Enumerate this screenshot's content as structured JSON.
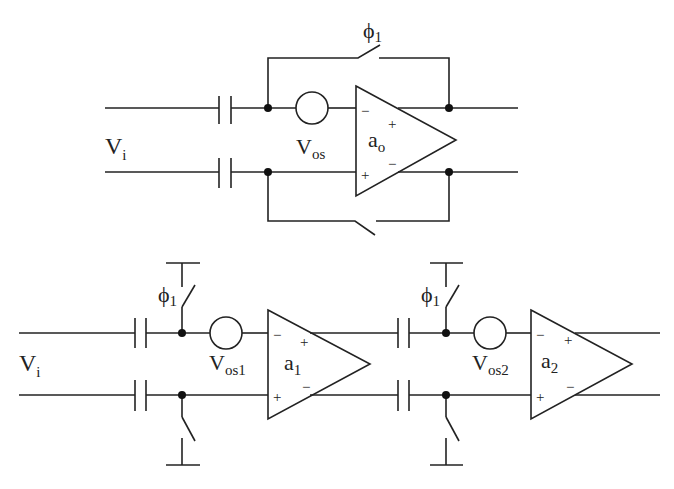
{
  "diagram": {
    "type": "circuit-schematic",
    "top_circuit": {
      "input_label": "V",
      "input_sub": "i",
      "offset_label": "V",
      "offset_sub": "os",
      "amp_label": "a",
      "amp_sub": "o",
      "switch_label": "ϕ",
      "switch_sub": "1",
      "in_minus": "−",
      "in_plus": "+",
      "out_plus": "+",
      "out_minus": "−"
    },
    "bottom_circuit": {
      "input_label": "V",
      "input_sub": "i",
      "stage1": {
        "switch_label": "ϕ",
        "switch_sub": "1",
        "offset_label": "V",
        "offset_sub": "os1",
        "amp_label": "a",
        "amp_sub": "1",
        "in_minus": "−",
        "in_plus": "+",
        "out_plus": "+",
        "out_minus": "−"
      },
      "stage2": {
        "switch_label": "ϕ",
        "switch_sub": "1",
        "offset_label": "V",
        "offset_sub": "os2",
        "amp_label": "a",
        "amp_sub": "2",
        "in_minus": "−",
        "in_plus": "+",
        "out_plus": "+",
        "out_minus": "−"
      }
    }
  }
}
